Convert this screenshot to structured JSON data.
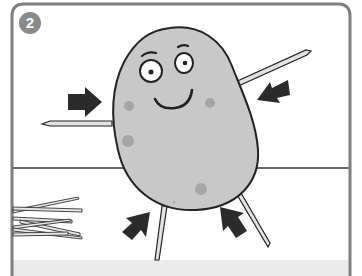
{
  "illustration": {
    "step_number": "2",
    "description": "Cartoon potato character with toothpick arms and legs being inserted, arrows pointing toward the body",
    "colors": {
      "frame": "#7f7f7f",
      "badge": "#8a8a8a",
      "potato_body": "#c8c8c8",
      "potato_spots": "#a6a6a6",
      "outline": "#222222",
      "arrows": "#2b2b2b",
      "toothpick_fill": "#e2e2e2",
      "bottom_band": "#ebebeb",
      "background": "#ffffff"
    },
    "elements": {
      "arrows": [
        "left-arm-arrow",
        "right-arm-arrow",
        "left-leg-arrow",
        "right-leg-arrow"
      ],
      "toothpicks": [
        "left-arm",
        "right-arm",
        "left-leg",
        "right-leg",
        "pile"
      ]
    }
  }
}
